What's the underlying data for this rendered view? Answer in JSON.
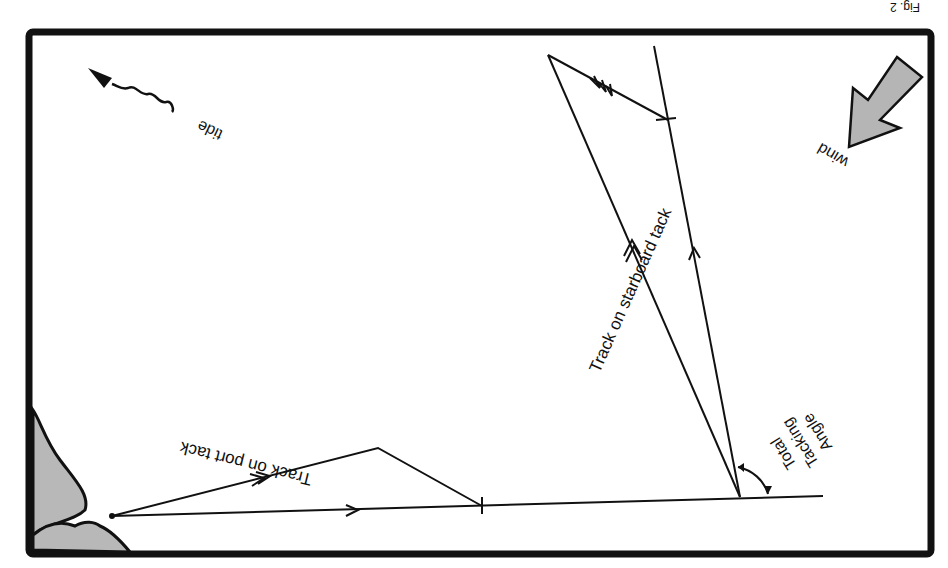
{
  "figure": {
    "orientation": "rotated 180 degrees",
    "caption_fragment": "Fig. 2",
    "colors": {
      "line": "#111111",
      "land": "#b8b8b8",
      "arrow_fill": "#b5b5b5",
      "background": "#ffffff"
    }
  },
  "labels": {
    "wind": "wind",
    "tide": "tide",
    "port_track": "Track on port tack",
    "starboard_track": "Track on starboard tack",
    "angle_line1": "Total",
    "angle_line2": "Tacking",
    "angle_line3": "Angle"
  },
  "icons": {
    "wind_arrow": "wind-arrow-icon",
    "tide_arrow": "tide-wavy-arrow-icon",
    "land": "coastline"
  }
}
